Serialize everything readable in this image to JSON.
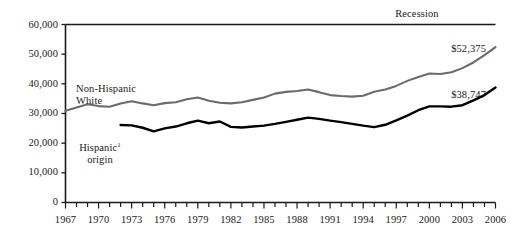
{
  "chart_data": {
    "type": "line",
    "title": "",
    "xlabel": "",
    "ylabel": "",
    "xlim": [
      1967,
      2006
    ],
    "ylim": [
      0,
      60000
    ],
    "grid": false,
    "legend_position": "inline-annotations",
    "y_ticks": [
      "0",
      "10,000",
      "20,000",
      "30,000",
      "40,000",
      "50,000",
      "60,000"
    ],
    "y_tick_values": [
      0,
      10000,
      20000,
      30000,
      40000,
      50000,
      60000
    ],
    "x_ticks": [
      "1967",
      "1970",
      "1973",
      "1976",
      "1979",
      "1982",
      "1985",
      "1988",
      "1991",
      "1994",
      "1997",
      "2000",
      "2003",
      "2006"
    ],
    "x_tick_values": [
      1967,
      1970,
      1973,
      1976,
      1979,
      1982,
      1985,
      1988,
      1991,
      1994,
      1997,
      2000,
      2003,
      2006
    ],
    "x_minor_tick_every": 1,
    "annotations": {
      "recession": "Recession",
      "series_white_line1": "Non-Hispanic",
      "series_white_line2": "White",
      "series_hispanic_line1": "Hispanic",
      "series_hispanic_footnote": "1",
      "series_hispanic_line2": "origin",
      "end_value_white": "$52,375",
      "end_value_hispanic": "$38,747"
    },
    "series": [
      {
        "name": "Non-Hispanic White",
        "color": "#6b6b6b",
        "end_label": "$52,375",
        "x": [
          1967,
          1968,
          1969,
          1970,
          1971,
          1972,
          1973,
          1974,
          1975,
          1976,
          1977,
          1978,
          1979,
          1980,
          1981,
          1982,
          1983,
          1984,
          1985,
          1986,
          1987,
          1988,
          1989,
          1990,
          1991,
          1992,
          1993,
          1994,
          1995,
          1996,
          1997,
          1998,
          1999,
          2000,
          2001,
          2002,
          2003,
          2004,
          2005,
          2006
        ],
        "values": [
          30900,
          32000,
          33100,
          32500,
          32300,
          33400,
          34100,
          33400,
          32800,
          33500,
          33800,
          34800,
          35400,
          34300,
          33600,
          33400,
          33800,
          34600,
          35400,
          36700,
          37300,
          37600,
          38100,
          37200,
          36200,
          35900,
          35700,
          36000,
          37300,
          38100,
          39300,
          41000,
          42300,
          43500,
          43300,
          43900,
          45300,
          47200,
          49700,
          52375
        ]
      },
      {
        "name": "Hispanic origin",
        "color": "#000000",
        "end_label": "$38,747",
        "x": [
          1972,
          1973,
          1974,
          1975,
          1976,
          1977,
          1978,
          1979,
          1980,
          1981,
          1982,
          1983,
          1984,
          1985,
          1986,
          1987,
          1988,
          1989,
          1990,
          1991,
          1992,
          1993,
          1994,
          1995,
          1996,
          1997,
          1998,
          1999,
          2000,
          2001,
          2002,
          2003,
          2004,
          2005,
          2006
        ],
        "values": [
          26100,
          26000,
          25200,
          24000,
          25000,
          25600,
          26700,
          27600,
          26700,
          27300,
          25500,
          25300,
          25600,
          25900,
          26500,
          27200,
          27900,
          28600,
          28200,
          27600,
          27100,
          26500,
          25900,
          25400,
          26200,
          27700,
          29300,
          31100,
          32400,
          32400,
          32300,
          32800,
          34400,
          36200,
          38747
        ]
      }
    ]
  },
  "axis": {
    "y_label_top": "60,000",
    "y_label_50": "50,000",
    "y_label_40": "40,000",
    "y_label_30": "30,000",
    "y_label_20": "20,000",
    "y_label_10": "10,000",
    "y_label_0": "0"
  }
}
